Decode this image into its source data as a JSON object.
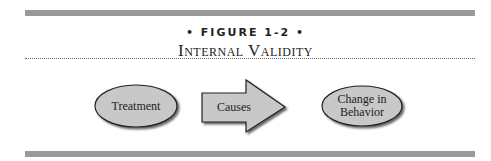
{
  "figure": {
    "label": "• FIGURE 1-2 •",
    "title": "Internal Validity"
  },
  "diagram": {
    "nodes": [
      {
        "id": "treatment",
        "shape": "ellipse",
        "label": "Treatment"
      },
      {
        "id": "causes",
        "shape": "arrow",
        "label": "Causes"
      },
      {
        "id": "change",
        "shape": "ellipse",
        "label_line1": "Change in",
        "label_line2": "Behavior"
      }
    ],
    "colors": {
      "fill": "#c8c8c8",
      "stroke": "#222222",
      "bar": "#9a9a9a"
    }
  }
}
